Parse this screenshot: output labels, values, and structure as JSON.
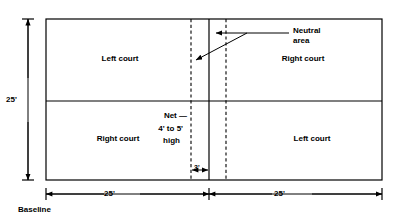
{
  "diagram": {
    "line_color": "#000000",
    "background": "#ffffff",
    "courts": {
      "top_left": "Left court",
      "top_right": "Right court",
      "bottom_left": "Right court",
      "bottom_right": "Left court"
    },
    "annotations": {
      "neutral_area_line1": "Neutral",
      "neutral_area_line2": "area",
      "net_line1": "Net —",
      "net_line2": "4' to 5'",
      "net_line3": "high",
      "baseline": "Baseline"
    },
    "dimensions": {
      "height_left": "25'",
      "width_left": "25'",
      "width_right": "25'",
      "neutral_width": "3'"
    }
  }
}
